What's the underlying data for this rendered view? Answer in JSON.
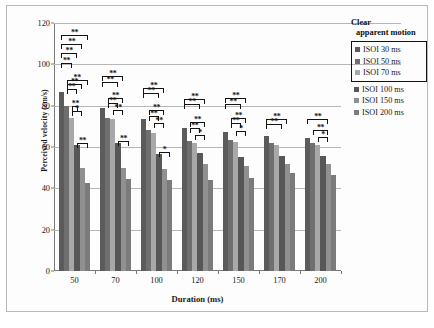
{
  "chart_data": {
    "type": "bar",
    "title": "",
    "xlabel": "Duration (ms)",
    "ylabel": "Perceived velocity (cm/s)",
    "categories": [
      "50",
      "70",
      "100",
      "120",
      "150",
      "170",
      "200"
    ],
    "ylim": [
      0,
      120
    ],
    "yticks": [
      0,
      20,
      40,
      60,
      80,
      100,
      120
    ],
    "grid": true,
    "legend_position": "right",
    "series": [
      {
        "name": "ISOI 30 ms",
        "color": "#5b5b5b",
        "values": [
          86.5,
          79.0,
          73.5,
          69.0,
          67.5,
          65.5,
          64.5
        ]
      },
      {
        "name": "ISOI 50 ms",
        "color": "#6f6f6f",
        "values": [
          80.0,
          74.0,
          68.0,
          63.0,
          63.5,
          62.0,
          62.0
        ]
      },
      {
        "name": "ISOI 70 ms",
        "color": "#a8a8a8",
        "values": [
          74.0,
          73.5,
          67.0,
          62.0,
          62.5,
          61.0,
          61.0
        ]
      },
      {
        "name": "ISOI 100 ms",
        "color": "#575757",
        "values": [
          61.0,
          62.0,
          56.5,
          57.0,
          55.0,
          55.5,
          55.5
        ]
      },
      {
        "name": "ISOI 150 ms",
        "color": "#909090",
        "values": [
          50.0,
          50.0,
          49.5,
          52.0,
          51.0,
          52.0,
          52.0
        ]
      },
      {
        "name": "ISOI 200 ms",
        "color": "#7b7b7b",
        "values": [
          42.5,
          44.5,
          44.0,
          44.0,
          45.0,
          47.5,
          46.5
        ]
      }
    ],
    "annotations": [
      {
        "group": "50",
        "from": 0,
        "to": 5,
        "level": 6,
        "stars": "**"
      },
      {
        "group": "50",
        "from": 0,
        "to": 4,
        "level": 5,
        "stars": "**"
      },
      {
        "group": "50",
        "from": 0,
        "to": 3,
        "level": 4,
        "stars": "**"
      },
      {
        "group": "50",
        "from": 0,
        "to": 2,
        "level": 3,
        "stars": "**"
      },
      {
        "group": "50",
        "from": 1,
        "to": 5,
        "level": 2.6,
        "stars": "**"
      },
      {
        "group": "50",
        "from": 1,
        "to": 4,
        "level": 2.1,
        "stars": "**"
      },
      {
        "group": "50",
        "from": 1,
        "to": 3,
        "level": 1.6,
        "stars": "**"
      },
      {
        "group": "50",
        "from": 2,
        "to": 3,
        "level": 1.1,
        "stars": "**"
      },
      {
        "group": "50",
        "from": 2,
        "to": 4,
        "level": 0.6,
        "stars": "*"
      },
      {
        "group": "50",
        "from": 3,
        "to": 5,
        "level": 0.0,
        "stars": "**"
      },
      {
        "group": "70",
        "from": 0,
        "to": 4,
        "level": 3.2,
        "stars": "**"
      },
      {
        "group": "70",
        "from": 0,
        "to": 3,
        "level": 2.6,
        "stars": "**"
      },
      {
        "group": "70",
        "from": 1,
        "to": 4,
        "level": 2.0,
        "stars": "**"
      },
      {
        "group": "70",
        "from": 1,
        "to": 3,
        "level": 1.4,
        "stars": "**"
      },
      {
        "group": "70",
        "from": 2,
        "to": 4,
        "level": 0.8,
        "stars": "**"
      },
      {
        "group": "70",
        "from": 3,
        "to": 5,
        "level": 0.0,
        "stars": "**"
      },
      {
        "group": "100",
        "from": 0,
        "to": 4,
        "level": 3.2,
        "stars": "**"
      },
      {
        "group": "100",
        "from": 0,
        "to": 3,
        "level": 2.6,
        "stars": "**"
      },
      {
        "group": "100",
        "from": 1,
        "to": 4,
        "level": 2.0,
        "stars": "**"
      },
      {
        "group": "100",
        "from": 1,
        "to": 3,
        "level": 1.4,
        "stars": "**"
      },
      {
        "group": "100",
        "from": 2,
        "to": 4,
        "level": 0.8,
        "stars": "**"
      },
      {
        "group": "100",
        "from": 3,
        "to": 5,
        "level": 0.0,
        "stars": "*"
      },
      {
        "group": "120",
        "from": 0,
        "to": 4,
        "level": 3.0,
        "stars": "**"
      },
      {
        "group": "120",
        "from": 0,
        "to": 3,
        "level": 2.4,
        "stars": "**"
      },
      {
        "group": "120",
        "from": 1,
        "to": 4,
        "level": 1.8,
        "stars": "**"
      },
      {
        "group": "120",
        "from": 1,
        "to": 3,
        "level": 1.2,
        "stars": "**"
      },
      {
        "group": "120",
        "from": 2,
        "to": 4,
        "level": 0.6,
        "stars": "*"
      },
      {
        "group": "150",
        "from": 0,
        "to": 4,
        "level": 3.4,
        "stars": "**"
      },
      {
        "group": "150",
        "from": 0,
        "to": 3,
        "level": 2.8,
        "stars": "**"
      },
      {
        "group": "150",
        "from": 1,
        "to": 4,
        "level": 2.2,
        "stars": "**"
      },
      {
        "group": "150",
        "from": 1,
        "to": 3,
        "level": 1.6,
        "stars": "**"
      },
      {
        "group": "150",
        "from": 2,
        "to": 4,
        "level": 1.0,
        "stars": "*"
      },
      {
        "group": "170",
        "from": 0,
        "to": 4,
        "level": 1.6,
        "stars": "**"
      },
      {
        "group": "170",
        "from": 0,
        "to": 3,
        "level": 1.0,
        "stars": "**"
      },
      {
        "group": "200",
        "from": 0,
        "to": 4,
        "level": 1.8,
        "stars": "**"
      },
      {
        "group": "200",
        "from": 1,
        "to": 4,
        "level": 1.2,
        "stars": "**"
      },
      {
        "group": "200",
        "from": 2,
        "to": 4,
        "level": 0.6,
        "stars": "*"
      }
    ]
  },
  "legend": {
    "title_line1": "Clear",
    "title_line2": "apparent motion",
    "boxed_count": 3
  }
}
